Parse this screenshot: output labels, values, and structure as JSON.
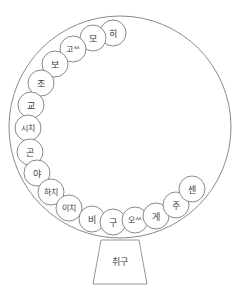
{
  "diagram": {
    "type": "circular-node-diagram",
    "title_text": "",
    "colors": {
      "stroke": "#8a8a8a",
      "node_stroke": "#7d7d7d",
      "node_fill": "#ffffff",
      "text": "#3b3b3b",
      "background": "#ffffff"
    },
    "main_circle": {
      "cx": 120,
      "cy": 127,
      "r": 111
    },
    "base": {
      "name": "mouthpiece",
      "label": "취구",
      "top_left_x": 101,
      "top_right_x": 139,
      "bottom_left_x": 93,
      "bottom_right_x": 147,
      "top_y": 240,
      "bottom_y": 284
    },
    "nodes": [
      {
        "label": "히",
        "cx": 113,
        "cy": 33,
        "r": 13,
        "font": 9
      },
      {
        "label": "모",
        "cx": 93,
        "cy": 38,
        "r": 13,
        "font": 9
      },
      {
        "label": "고ᄊ",
        "cx": 73,
        "cy": 49,
        "r": 13,
        "font": 8
      },
      {
        "label": "보",
        "cx": 55,
        "cy": 64,
        "r": 13,
        "font": 9
      },
      {
        "label": "조",
        "cx": 41,
        "cy": 83,
        "r": 13,
        "font": 9
      },
      {
        "label": "교",
        "cx": 31,
        "cy": 105,
        "r": 13,
        "font": 9
      },
      {
        "label": "시치",
        "cx": 28,
        "cy": 128,
        "r": 13,
        "font": 8
      },
      {
        "label": "곤",
        "cx": 30,
        "cy": 152,
        "r": 13,
        "font": 9
      },
      {
        "label": "야",
        "cx": 37,
        "cy": 173,
        "r": 13,
        "font": 9
      },
      {
        "label": "하치",
        "cx": 51,
        "cy": 192,
        "r": 13,
        "font": 8
      },
      {
        "label": "이치",
        "cx": 69,
        "cy": 208,
        "r": 13,
        "font": 8
      },
      {
        "label": "비",
        "cx": 92,
        "cy": 219,
        "r": 13,
        "font": 9
      },
      {
        "label": "구",
        "cx": 113,
        "cy": 222,
        "r": 13,
        "font": 9
      },
      {
        "label": "오ᄊ",
        "cx": 135,
        "cy": 220,
        "r": 13,
        "font": 8
      },
      {
        "label": "게",
        "cx": 156,
        "cy": 216,
        "r": 13,
        "font": 9
      },
      {
        "label": "주",
        "cx": 176,
        "cy": 205,
        "r": 13,
        "font": 9
      },
      {
        "label": "센",
        "cx": 192,
        "cy": 189,
        "r": 13,
        "font": 9
      }
    ]
  }
}
